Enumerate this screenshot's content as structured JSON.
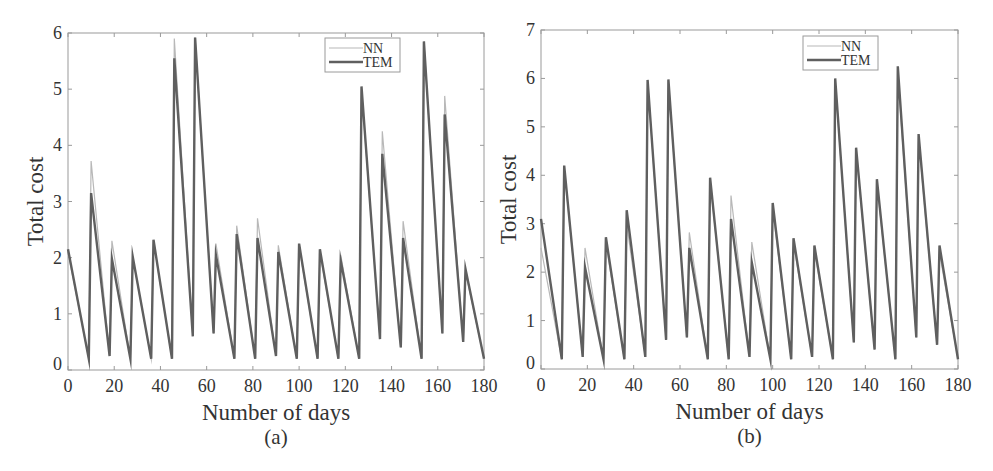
{
  "chart_data": [
    {
      "id": "a",
      "type": "line",
      "caption": "(a)",
      "title": "",
      "xlabel": "Number of days",
      "ylabel": "Total cost",
      "xlim": [
        0,
        180
      ],
      "ylim": [
        0,
        6
      ],
      "xticks": [
        0,
        20,
        40,
        60,
        80,
        100,
        120,
        140,
        160,
        180
      ],
      "yticks": [
        0,
        1,
        2,
        3,
        4,
        5,
        6
      ],
      "grid": false,
      "legend": {
        "position": "upper-right-inset",
        "entries": [
          "NN",
          "TEM"
        ]
      },
      "series": [
        {
          "name": "NN",
          "color": "#b8b8b8",
          "width": 1.2,
          "x": [
            0,
            9,
            10,
            18,
            19,
            27,
            28,
            36,
            37,
            45,
            46,
            54,
            55,
            63,
            64,
            72,
            73,
            81,
            82,
            90,
            91,
            99,
            100,
            108,
            109,
            117,
            118,
            126,
            127,
            135,
            136,
            144,
            145,
            153,
            154,
            162,
            163,
            171,
            172,
            180
          ],
          "y": [
            2.1,
            0.2,
            3.72,
            0.25,
            2.3,
            0.2,
            2.0,
            0.2,
            2.3,
            0.2,
            5.9,
            0.6,
            5.92,
            0.65,
            2.25,
            0.2,
            2.57,
            0.2,
            2.7,
            0.25,
            2.22,
            0.2,
            2.2,
            0.2,
            2.1,
            0.2,
            2.05,
            0.2,
            5.0,
            0.55,
            4.25,
            0.4,
            2.65,
            0.2,
            5.85,
            0.65,
            4.88,
            0.5,
            1.75,
            0.2
          ]
        },
        {
          "name": "TEM",
          "color": "#5f5f5f",
          "width": 2.4,
          "x": [
            0,
            9,
            10,
            18,
            19,
            27,
            28,
            36,
            37,
            45,
            46,
            54,
            55,
            63,
            64,
            72,
            73,
            81,
            82,
            90,
            91,
            99,
            100,
            108,
            109,
            117,
            118,
            126,
            127,
            135,
            136,
            144,
            145,
            153,
            154,
            162,
            163,
            171,
            172,
            180
          ],
          "y": [
            2.15,
            0.2,
            3.15,
            0.25,
            1.98,
            0.2,
            2.02,
            0.2,
            2.32,
            0.2,
            5.55,
            0.6,
            5.92,
            0.65,
            2.05,
            0.2,
            2.42,
            0.2,
            2.35,
            0.25,
            2.1,
            0.2,
            2.25,
            0.2,
            2.15,
            0.2,
            1.95,
            0.2,
            5.05,
            0.55,
            3.85,
            0.4,
            2.35,
            0.2,
            5.85,
            0.65,
            4.55,
            0.5,
            1.8,
            0.2
          ]
        }
      ]
    },
    {
      "id": "b",
      "type": "line",
      "caption": "(b)",
      "title": "",
      "xlabel": "Number of days",
      "ylabel": "Total cost",
      "xlim": [
        0,
        180
      ],
      "ylim": [
        0,
        7
      ],
      "xticks": [
        0,
        20,
        40,
        60,
        80,
        100,
        120,
        140,
        160,
        180
      ],
      "yticks": [
        0,
        1,
        2,
        3,
        4,
        5,
        6,
        7
      ],
      "grid": false,
      "legend": {
        "position": "upper-right-inset",
        "entries": [
          "NN",
          "TEM"
        ]
      },
      "series": [
        {
          "name": "NN",
          "color": "#b8b8b8",
          "width": 1.2,
          "x": [
            0,
            9,
            10,
            18,
            19,
            27,
            28,
            36,
            37,
            45,
            46,
            54,
            55,
            63,
            64,
            72,
            73,
            81,
            82,
            90,
            91,
            99,
            100,
            108,
            109,
            117,
            118,
            126,
            127,
            135,
            136,
            144,
            145,
            153,
            154,
            162,
            163,
            171,
            172,
            180
          ],
          "y": [
            2.5,
            0.2,
            4.15,
            0.25,
            2.5,
            0.2,
            2.6,
            0.2,
            3.0,
            0.25,
            5.95,
            0.6,
            5.95,
            0.65,
            2.82,
            0.2,
            3.9,
            0.2,
            3.58,
            0.25,
            2.62,
            0.2,
            3.3,
            0.2,
            2.6,
            0.25,
            2.45,
            0.2,
            5.95,
            0.55,
            4.5,
            0.4,
            3.85,
            0.2,
            6.1,
            0.65,
            4.75,
            0.5,
            2.4,
            0.2
          ]
        },
        {
          "name": "TEM",
          "color": "#5f5f5f",
          "width": 2.4,
          "x": [
            0,
            9,
            10,
            18,
            19,
            27,
            28,
            36,
            37,
            45,
            46,
            54,
            55,
            63,
            64,
            72,
            73,
            81,
            82,
            90,
            91,
            99,
            100,
            108,
            109,
            117,
            118,
            126,
            127,
            135,
            136,
            144,
            145,
            153,
            154,
            162,
            163,
            171,
            172,
            180
          ],
          "y": [
            3.1,
            0.2,
            4.2,
            0.25,
            2.1,
            0.2,
            2.72,
            0.2,
            3.28,
            0.25,
            5.97,
            0.6,
            5.98,
            0.65,
            2.5,
            0.2,
            3.95,
            0.2,
            3.1,
            0.25,
            2.2,
            0.2,
            3.43,
            0.2,
            2.7,
            0.25,
            2.55,
            0.2,
            6.0,
            0.55,
            4.57,
            0.4,
            3.92,
            0.2,
            6.25,
            0.65,
            4.85,
            0.5,
            2.55,
            0.2
          ]
        }
      ]
    }
  ]
}
